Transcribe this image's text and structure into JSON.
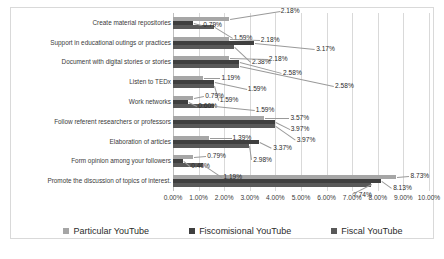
{
  "chart_data": {
    "type": "bar",
    "orientation": "horizontal",
    "title": "",
    "xlabel": "",
    "ylabel": "",
    "xlim": [
      0,
      10
    ],
    "xticks": [
      "0.00%",
      "1.00%",
      "2.00%",
      "3.00%",
      "4.00%",
      "5.00%",
      "6.00%",
      "7.00%",
      "8.00%",
      "9.00%",
      "10.00%"
    ],
    "grid": true,
    "legend_position": "bottom",
    "categories": [
      "Create material repositories",
      "Support in educational outings or practices",
      "Document with digital stories or stories",
      "Listen to TEDx",
      "Work networks",
      "Follow referent researchers or professors",
      "Elaboration of articles",
      "Form opinion among your followers",
      "Promote the discussion of topics of interest."
    ],
    "series": [
      {
        "name": "Particular YouTube",
        "color": "#a6a6a6",
        "values": [
          2.18,
          2.18,
          2.18,
          1.19,
          0.79,
          3.57,
          1.39,
          0.79,
          8.73
        ],
        "labels": [
          "2.18%",
          "2.18%",
          "2.18%",
          "1.19%",
          "0.79%",
          "3.57%",
          "1.39%",
          "0.79%",
          "8.73%"
        ]
      },
      {
        "name": "Fiscomisional YouTube",
        "color": "#3f3f3f",
        "values": [
          0.79,
          3.17,
          2.58,
          1.59,
          0.6,
          3.97,
          3.37,
          0.4,
          8.13
        ],
        "labels": [
          "0.79%",
          "3.17%",
          "2.58%",
          "1.59%",
          "0.60%",
          "3.97%",
          "3.37%",
          "0.40%",
          "8.13%"
        ]
      },
      {
        "name": "Fiscal YouTube",
        "color": "#595959",
        "values": [
          1.59,
          2.38,
          2.58,
          1.59,
          1.59,
          3.97,
          2.98,
          1.19,
          7.74
        ],
        "labels": [
          "1.59%",
          "2.38%",
          "2.58%",
          "1.59%",
          "1.59%",
          "3.97%",
          "2.98%",
          "1.19%",
          "7.74%"
        ]
      }
    ]
  },
  "legend": {
    "items": [
      {
        "label": "Particular YouTube",
        "color": "#a6a6a6"
      },
      {
        "label": "Fiscomisional YouTube",
        "color": "#3f3f3f"
      },
      {
        "label": "Fiscal YouTube",
        "color": "#595959"
      }
    ]
  }
}
